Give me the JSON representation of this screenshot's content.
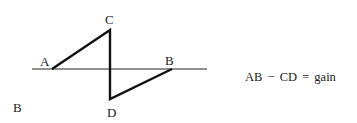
{
  "diagram": {
    "labels": {
      "A": "A",
      "B_right": "B",
      "C": "C",
      "D": "D",
      "B_side": "B"
    },
    "equation": "AB − CD = gain",
    "points": {
      "A": [
        52,
        69
      ],
      "C": [
        110,
        30
      ],
      "D": [
        110,
        99
      ],
      "B": [
        172,
        69
      ]
    },
    "baseline": {
      "x1": 32,
      "x2": 207,
      "y": 69
    }
  }
}
